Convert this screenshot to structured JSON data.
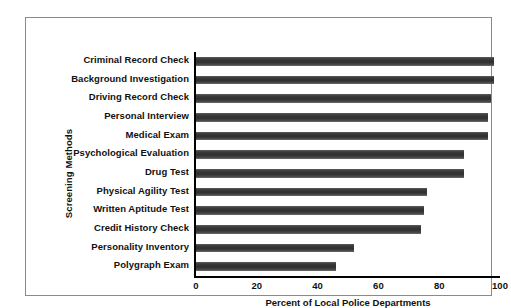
{
  "chart_data": {
    "type": "bar",
    "orientation": "horizontal",
    "title": "",
    "xlabel": "Percent of Local Police Departments",
    "ylabel": "Screening Methods",
    "xlim": [
      0,
      100
    ],
    "xticks": [
      0,
      20,
      40,
      60,
      80,
      100
    ],
    "xtick_labels": [
      "0",
      "20",
      "40",
      "60",
      "80",
      "100"
    ],
    "grid": false,
    "legend": null,
    "bar_color": "#3a3a3a",
    "categories": [
      "Criminal Record Check",
      "Background Investigation",
      "Driving Record Check",
      "Personal Interview",
      "Medical Exam",
      "Psychological Evaluation",
      "Drug Test",
      "Physical Agility Test",
      "Written Aptitude Test",
      "Credit History Check",
      "Personality Inventory",
      "Polygraph Exam"
    ],
    "values": [
      98,
      98,
      97,
      96,
      96,
      88,
      88,
      76,
      75,
      74,
      52,
      46
    ],
    "bars": [
      {
        "label": "Criminal Record Check",
        "value": 98
      },
      {
        "label": "Background Investigation",
        "value": 98
      },
      {
        "label": "Driving Record Check",
        "value": 97
      },
      {
        "label": "Personal Interview",
        "value": 96
      },
      {
        "label": "Medical Exam",
        "value": 96
      },
      {
        "label": "Psychological Evaluation",
        "value": 88
      },
      {
        "label": "Drug Test",
        "value": 88
      },
      {
        "label": "Physical Agility Test",
        "value": 76
      },
      {
        "label": "Written Aptitude Test",
        "value": 75
      },
      {
        "label": "Credit History Check",
        "value": 74
      },
      {
        "label": "Personality Inventory",
        "value": 52
      },
      {
        "label": "Polygraph Exam",
        "value": 46
      }
    ]
  }
}
